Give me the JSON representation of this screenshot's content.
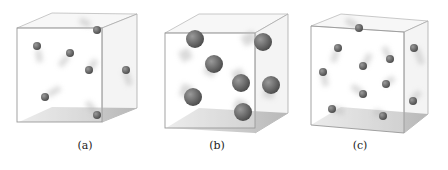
{
  "figure": {
    "panels": [
      {
        "label": "(a)",
        "description": "Cube with 7 small spheres (gas particles) with motion trails"
      },
      {
        "label": "(b)",
        "description": "Cube with 7 large spheres (gas particles) with motion trails"
      },
      {
        "label": "(c)",
        "description": "Cube with 11 small spheres (gas particles) with motion trails"
      }
    ]
  }
}
